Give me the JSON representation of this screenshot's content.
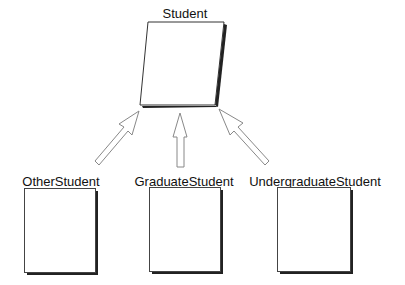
{
  "diagram": {
    "type": "class-hierarchy",
    "parent": {
      "name": "Student",
      "shape": "parallelogram"
    },
    "children": [
      {
        "name": "OtherStudent"
      },
      {
        "name": "GraduateStudent"
      },
      {
        "name": "UndergraduateStudent"
      }
    ],
    "relations": [
      {
        "from": "OtherStudent",
        "to": "Student",
        "arrow": "hollow-block"
      },
      {
        "from": "GraduateStudent",
        "to": "Student",
        "arrow": "hollow-block"
      },
      {
        "from": "UndergraduateStudent",
        "to": "Student",
        "arrow": "hollow-block"
      }
    ],
    "colors": {
      "stroke": "#333333",
      "shadow": "#222222",
      "fill": "#ffffff",
      "arrow_stroke": "#777777"
    }
  }
}
